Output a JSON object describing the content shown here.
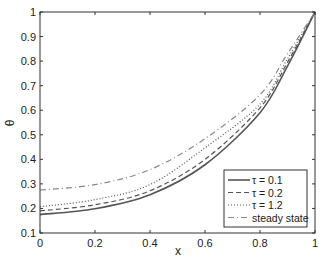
{
  "chart_data": {
    "type": "line",
    "title": "",
    "xlabel": "x",
    "ylabel": "θ",
    "xlim": [
      0,
      1
    ],
    "ylim": [
      0.1,
      1
    ],
    "grid": false,
    "legend_position": "lower right",
    "x_ticks": [
      "0",
      "0.2",
      "0.4",
      "0.6",
      "0.8",
      "1"
    ],
    "y_ticks": [
      "0.1",
      "0.2",
      "0.3",
      "0.4",
      "0.5",
      "0.6",
      "0.7",
      "0.8",
      "0.9",
      "1"
    ],
    "x": [
      0,
      0.2,
      0.4,
      0.6,
      0.8,
      0.9,
      1.0
    ],
    "series": [
      {
        "name": "τ = 0.1",
        "style": "solid",
        "color": "#555555",
        "values": [
          0.175,
          0.199,
          0.256,
          0.378,
          0.59,
          0.78,
          1.0
        ]
      },
      {
        "name": "τ = 0.2",
        "style": "dashed",
        "color": "#555555",
        "values": [
          0.19,
          0.215,
          0.272,
          0.4,
          0.61,
          0.795,
          1.0
        ]
      },
      {
        "name": "τ = 1.2",
        "style": "dotted",
        "color": "#555555",
        "values": [
          0.207,
          0.236,
          0.297,
          0.447,
          0.625,
          0.81,
          1.0
        ]
      },
      {
        "name": "steady state",
        "style": "dash-dot",
        "color": "#888888",
        "values": [
          0.275,
          0.297,
          0.358,
          0.484,
          0.663,
          0.83,
          1.0
        ]
      }
    ]
  }
}
